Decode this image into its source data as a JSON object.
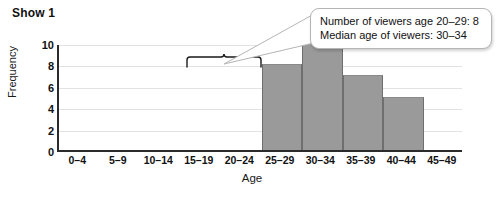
{
  "chart_data": {
    "type": "bar",
    "title": "Show 1",
    "xlabel": "Age",
    "ylabel": "Frequency",
    "categories": [
      "0–4",
      "5–9",
      "10–14",
      "15–19",
      "20–24",
      "25–29",
      "30–34",
      "35–39",
      "40–44",
      "45–49"
    ],
    "values": [
      0,
      0,
      0,
      0,
      0,
      8,
      10,
      7,
      5,
      0
    ],
    "ylim": [
      0,
      10
    ],
    "y_ticks": [
      0,
      2,
      4,
      6,
      8,
      10
    ],
    "grid": true,
    "legend": null,
    "bar_color": "#9a9a9a",
    "axis_color": "#2b2b2b",
    "annotations": {
      "bracket": {
        "label": "bracket-over-20-to-29",
        "start_category": "20–24",
        "end_category": "25–29"
      },
      "callout": {
        "lines": [
          "Number of viewers age 20–29: 8",
          "Median age of viewers: 30–34"
        ]
      }
    }
  }
}
